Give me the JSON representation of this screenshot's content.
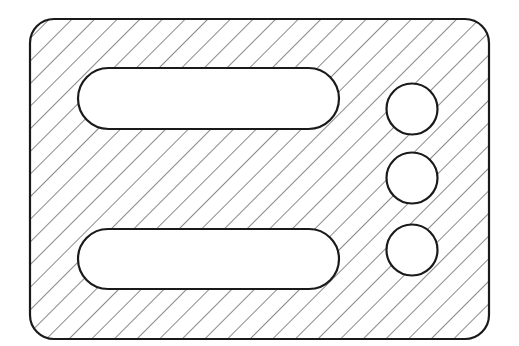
{
  "diagram": {
    "type": "hatched-section-plate",
    "canvas": {
      "width": 519,
      "height": 346,
      "background": "#ffffff"
    },
    "colors": {
      "stroke": "#1a1a1a",
      "hatch": "#2a2a2a",
      "hole_fill": "#ffffff"
    },
    "plate": {
      "x": 30,
      "y": 19,
      "width": 459,
      "height": 320,
      "corner_radius": 24,
      "stroke_width": 2.2,
      "hatch": {
        "angle_deg": 45,
        "spacing": 16,
        "stroke_width": 1.1
      }
    },
    "slots": [
      {
        "name": "upper-slot",
        "x": 78,
        "y": 68,
        "width": 261,
        "height": 61
      },
      {
        "name": "lower-slot",
        "x": 78,
        "y": 229,
        "width": 261,
        "height": 60
      }
    ],
    "holes": [
      {
        "name": "hole-top",
        "cx": 412,
        "cy": 109,
        "r": 25.5
      },
      {
        "name": "hole-middle",
        "cx": 412,
        "cy": 178,
        "r": 25.5
      },
      {
        "name": "hole-bottom",
        "cx": 412,
        "cy": 250,
        "r": 25.5
      }
    ],
    "feature_stroke_width": 2.2
  }
}
